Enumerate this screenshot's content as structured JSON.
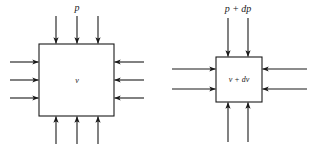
{
  "figure": {
    "title": "",
    "background_color": "#ffffff",
    "stroke_color": "#1a1a1a",
    "width": 312,
    "height": 149
  },
  "diagrams": [
    {
      "id": "left-element",
      "name": "fluid-element-initial",
      "box": {
        "x": 39,
        "y": 44,
        "width": 75,
        "height": 72
      },
      "top_label": "p",
      "inner_label": "v",
      "arrows_per_side": 3,
      "arrow_direction": "inward",
      "sides": [
        "top",
        "right",
        "bottom",
        "left"
      ]
    },
    {
      "id": "right-element",
      "name": "fluid-element-compressed",
      "box": {
        "x": 216,
        "y": 57,
        "width": 46,
        "height": 45
      },
      "top_label": "p + dp",
      "inner_label": "v + dv",
      "arrows_per_side": 2,
      "arrow_direction": "inward",
      "sides": [
        "top",
        "right",
        "bottom",
        "left"
      ]
    }
  ],
  "labels": {
    "left_pressure": "p",
    "left_volume": "v",
    "right_pressure": "p + dp",
    "right_volume": "v + dv"
  }
}
